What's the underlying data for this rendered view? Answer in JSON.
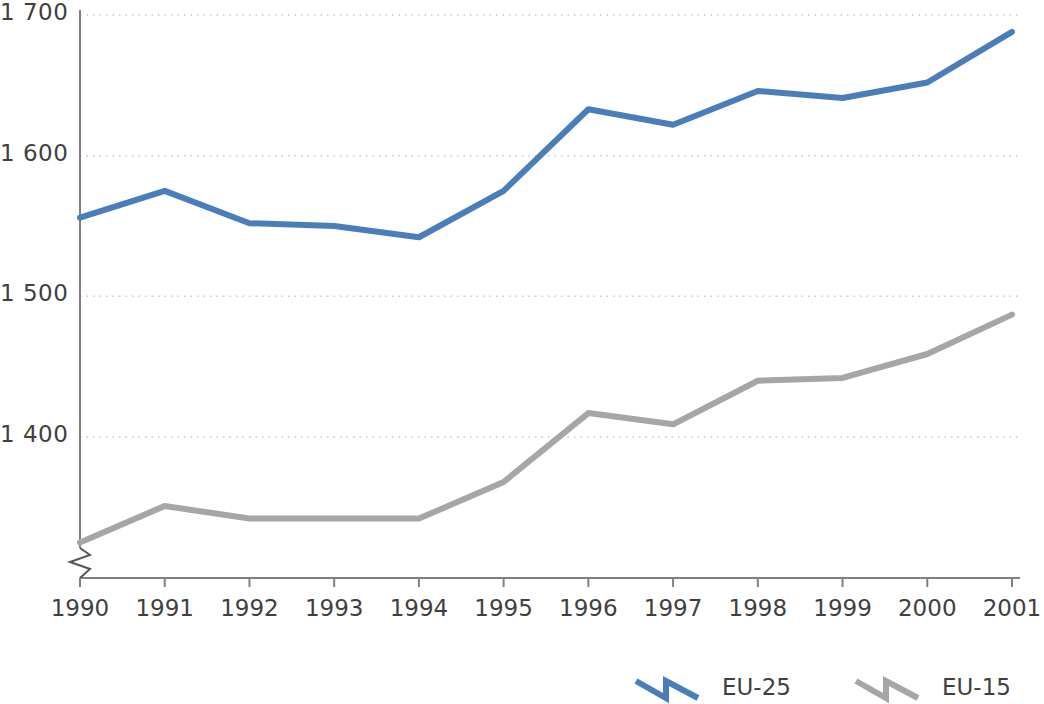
{
  "chart_data": {
    "type": "line",
    "title": "",
    "subtitle": "",
    "xlabel": "",
    "ylabel": "",
    "categories": [
      "1990",
      "1991",
      "1992",
      "1993",
      "1994",
      "1995",
      "1996",
      "1997",
      "1998",
      "1999",
      "2000",
      "2001"
    ],
    "x_tick_labels": [
      "1990",
      "1991",
      "1992",
      "1993",
      "1994",
      "1995",
      "1996",
      "1997",
      "1998",
      "1999",
      "2000",
      "2001"
    ],
    "y_tick_labels": [
      "1 400",
      "1 500",
      "1 600",
      "1 700"
    ],
    "y_tick_values": [
      1400,
      1500,
      1600,
      1700
    ],
    "ylim": [
      1320,
      1710
    ],
    "y_axis_broken": true,
    "grid": true,
    "grid_axis": "y",
    "grid_style": "dotted",
    "legend_position": "bottom-right",
    "series": [
      {
        "name": "EU-25",
        "color": "#4a7ebb",
        "values": [
          1556,
          1575,
          1552,
          1550,
          1542,
          1575,
          1633,
          1622,
          1646,
          1641,
          1652,
          1688
        ]
      },
      {
        "name": "EU-15",
        "color": "#a6a6a6",
        "values": [
          1325,
          1351,
          1342,
          1342,
          1342,
          1368,
          1417,
          1409,
          1440,
          1442,
          1459,
          1487
        ]
      }
    ]
  },
  "legend": {
    "entries": [
      {
        "label": "EU-25",
        "color": "#4a7ebb"
      },
      {
        "label": "EU-15",
        "color": "#a6a6a6"
      }
    ]
  },
  "colors": {
    "series_eu25": "#4a7ebb",
    "series_eu15": "#a6a6a6",
    "axis": "#808080",
    "grid": "#c8c8c8",
    "text": "#3f3f3f",
    "background": "#ffffff"
  }
}
